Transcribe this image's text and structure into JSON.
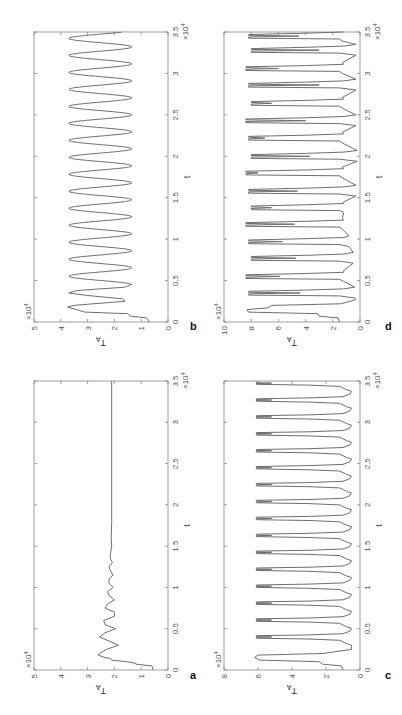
{
  "figure": {
    "orientation": "rotated 90 degrees clockwise on page",
    "panels": [
      "a",
      "b",
      "c",
      "d"
    ]
  },
  "chart_data": [
    {
      "panel": "a",
      "type": "line",
      "title": "",
      "xlabel": "t",
      "ylabel": "T_A",
      "x_multiplier": "×10^4",
      "y_multiplier": "×10^4",
      "xlim": [
        0,
        3.5
      ],
      "ylim": [
        0,
        5
      ],
      "xticks": [
        "0",
        "0.5",
        "1",
        "1.5",
        "2",
        "2.5",
        "3",
        "3.5"
      ],
      "yticks": [
        "0",
        "1",
        "2",
        "3",
        "4",
        "5"
      ],
      "grid": false,
      "description": "Damped oscillation converging to steady state ~2.1",
      "series": [
        {
          "name": "T_A",
          "x": [
            0,
            0.05,
            0.07,
            0.08,
            0.1,
            0.12,
            0.14,
            0.15,
            0.18,
            0.2,
            0.25,
            0.3,
            0.35,
            0.4,
            0.45,
            0.5,
            0.55,
            0.6,
            0.65,
            0.7,
            0.75,
            0.8,
            0.85,
            0.9,
            0.95,
            1.0,
            1.05,
            1.1,
            1.15,
            1.2,
            1.25,
            1.3,
            1.35,
            1.4,
            1.5,
            1.6,
            1.8,
            2.0,
            3.5
          ],
          "values": [
            0.55,
            0.6,
            1.2,
            1.2,
            1.55,
            2.1,
            2.15,
            2.35,
            2.6,
            2.55,
            2.3,
            1.85,
            2.2,
            2.55,
            2.35,
            1.95,
            2.35,
            2.4,
            2.0,
            2.0,
            2.35,
            2.25,
            2.0,
            2.2,
            2.25,
            2.05,
            2.2,
            2.2,
            2.05,
            2.15,
            2.2,
            2.08,
            2.15,
            2.15,
            2.1,
            2.12,
            2.1,
            2.1,
            2.1
          ]
        }
      ]
    },
    {
      "panel": "b",
      "type": "line",
      "title": "",
      "xlabel": "t",
      "ylabel": "T_A",
      "x_multiplier": "×10^4",
      "y_multiplier": "×10^4",
      "xlim": [
        0,
        3.5
      ],
      "ylim": [
        0,
        5
      ],
      "xticks": [
        "0",
        "0.5",
        "1",
        "1.5",
        "2",
        "2.5",
        "3",
        "3.5"
      ],
      "yticks": [
        "0",
        "1",
        "2",
        "3",
        "4",
        "5"
      ],
      "grid": false,
      "description": "Sustained periodic oscillation between ~1.4 and ~3.7, period ~0.2e4",
      "series": [
        {
          "name": "T_A",
          "x": [
            0,
            0.05,
            0.07,
            0.1,
            0.12,
            0.15,
            0.18,
            0.2,
            0.22,
            0.25,
            0.28,
            0.32,
            0.35,
            0.38,
            0.42,
            0.45
          ],
          "values": [
            0.7,
            0.8,
            1.4,
            1.5,
            3.1,
            3.4,
            3.75,
            3.5,
            2.8,
            1.6,
            1.7,
            3.0,
            3.7,
            3.4,
            1.6,
            1.4
          ],
          "periodic_after": {
            "t_start": 0.45,
            "period": 0.205,
            "min": 1.35,
            "max": 3.7,
            "t_end": 3.5
          }
        }
      ]
    },
    {
      "panel": "c",
      "type": "line",
      "title": "",
      "xlabel": "t",
      "ylabel": "T_A",
      "x_multiplier": "×10^4",
      "y_multiplier": "×10^4",
      "xlim": [
        0,
        3.5
      ],
      "ylim": [
        0,
        8
      ],
      "xticks": [
        "0",
        "0.5",
        "1",
        "1.5",
        "2",
        "2.5",
        "3",
        "3.5"
      ],
      "yticks": [
        "0",
        "2",
        "4",
        "6",
        "8"
      ],
      "grid": false,
      "description": "Bursting oscillation: flat tops ~6 with double-peak 'M' dips to ~5.2, troughs ~0.5, period ~0.205e4",
      "series": [
        {
          "name": "T_A",
          "periodic": {
            "t_start": 0.3,
            "period": 0.205,
            "peak": 6.1,
            "notch": 5.2,
            "trough": 0.5,
            "t_end": 3.5
          },
          "initial": {
            "x": [
              0,
              0.05,
              0.07,
              0.1,
              0.12,
              0.15,
              0.18,
              0.2,
              0.25
            ],
            "values": [
              1.0,
              1.1,
              2.2,
              2.4,
              5.9,
              6.2,
              6.0,
              2.2,
              0.5
            ]
          }
        }
      ]
    },
    {
      "panel": "d",
      "type": "line",
      "title": "",
      "xlabel": "t",
      "ylabel": "T_A",
      "x_multiplier": "×10^4",
      "y_multiplier": "×10^4",
      "xlim": [
        0,
        3.5
      ],
      "ylim": [
        0,
        10
      ],
      "xticks": [
        "0",
        "0.5",
        "1",
        "1.5",
        "2",
        "2.5",
        "3",
        "3.5"
      ],
      "yticks": [
        "0",
        "2",
        "4",
        "6",
        "8",
        "10"
      ],
      "grid": false,
      "description": "Irregular (chaotic-like) bursting: peaks ~8-8.5, deep inner dips to 3-6, troughs ~0.3-1.5",
      "series": [
        {
          "name": "T_A",
          "bursts_t": [
            0.15,
            0.35,
            0.55,
            0.77,
            0.97,
            1.18,
            1.38,
            1.58,
            1.8,
            2.0,
            2.22,
            2.43,
            2.64,
            2.86,
            3.06,
            3.28,
            3.45
          ],
          "burst_dips": [
            8.2,
            4.4,
            5.9,
            4.7,
            5.7,
            4.8,
            6.5,
            4.6,
            7.5,
            3.7,
            7.0,
            4.0,
            6.5,
            3.0,
            6.0,
            3.0,
            4.5
          ],
          "trough_values": [
            0.3,
            0.4,
            1.2,
            0.5,
            0.8,
            1.3,
            1.2,
            0.3,
            1.3,
            0.2,
            1.3,
            0.3,
            1.3,
            0.3,
            1.3,
            0.3,
            1.3
          ]
        }
      ]
    }
  ],
  "labels": {
    "a": "a",
    "b": "b",
    "c": "c",
    "d": "d",
    "xlabel": "t",
    "ylabel_main": "T",
    "ylabel_sub": "A",
    "exp_base": "×10",
    "exp_power": "4"
  },
  "colors": {
    "line": "#6e6e6e",
    "axis": "#888888",
    "text": "#555555",
    "background": "#ffffff"
  }
}
